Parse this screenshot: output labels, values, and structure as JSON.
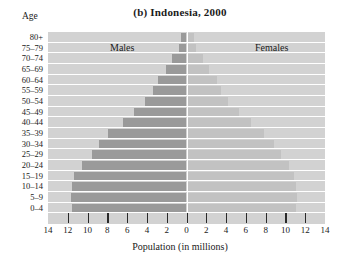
{
  "chart_data": {
    "type": "bar",
    "subtype": "population-pyramid",
    "title": "(b) Indonesia, 2000",
    "xlabel": "Population (in millions)",
    "ylabel": "Age",
    "unit": "millions",
    "grid": true,
    "legend_position": "in-plot",
    "xlim": [
      -14,
      14
    ],
    "xtick_values": [
      -14,
      -12,
      -10,
      -8,
      -6,
      -4,
      -2,
      0,
      2,
      4,
      6,
      8,
      10,
      12,
      14
    ],
    "xtick_labels": [
      "14",
      "12",
      "10",
      "8",
      "6",
      "4",
      "2",
      "0",
      "2",
      "4",
      "6",
      "8",
      "10",
      "12",
      "14"
    ],
    "categories": [
      "0–4",
      "5–9",
      "10–14",
      "15–19",
      "20–24",
      "25–29",
      "30–34",
      "35–39",
      "40–44",
      "45–49",
      "50–54",
      "55–59",
      "60–64",
      "65–69",
      "70–74",
      "75–79",
      "80+"
    ],
    "series": [
      {
        "name": "Males",
        "side": "left",
        "color": "#9a9a9a",
        "values": [
          11.6,
          11.7,
          11.6,
          11.4,
          10.6,
          9.6,
          8.8,
          7.9,
          6.4,
          5.3,
          4.2,
          3.4,
          2.9,
          2.1,
          1.5,
          0.8,
          0.6
        ]
      },
      {
        "name": "Females",
        "side": "right",
        "color": "#c2c2c2",
        "values": [
          11.1,
          11.2,
          11.1,
          10.9,
          10.4,
          9.6,
          8.8,
          7.8,
          6.5,
          5.3,
          4.2,
          3.5,
          3.1,
          2.3,
          1.7,
          1.0,
          0.8
        ]
      }
    ]
  },
  "labels": {
    "age_caption": "Age",
    "males": "Males",
    "females": "Females"
  },
  "colors": {
    "plot_background": "#d2d2d2",
    "gridline": "#ffffff",
    "centerline": "#ffffff",
    "male_bar": "#9a9a9a",
    "female_bar": "#c2c2c2",
    "tick": "#2a2a2a",
    "text": "#1a1a1a"
  }
}
